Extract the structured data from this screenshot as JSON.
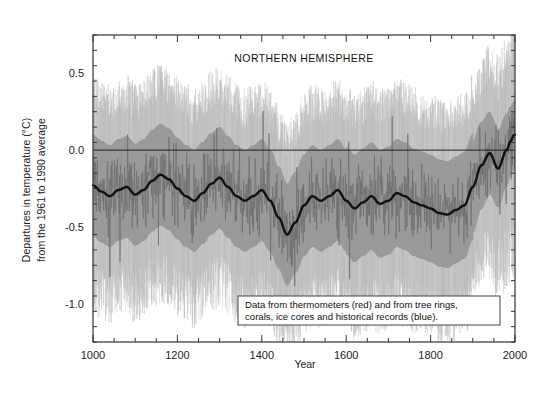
{
  "figure": {
    "title": "(b) the past 1,000 years",
    "panel_annotation": "NORTHERN HEMISPHERE",
    "legend_note_line1": "Data from thermometers (red) and from tree rings,",
    "legend_note_line2": "corals, ice cores and historical records (blue)."
  },
  "colors": {
    "background": "#ffffff",
    "axis": "#333333",
    "uncertainty_band": "#b4b4b4",
    "smoothed_curve": "#111111",
    "annual_series": "#6e6e6e",
    "zero_line": "#222222",
    "legend_border": "#444444"
  },
  "chart_data": {
    "type": "line",
    "title": "(b) the past 1,000 years",
    "subtitle": "NORTHERN HEMISPHERE",
    "xlabel": "Year",
    "ylabel": "Departures in temperature (°C) from the 1961 to 1990 average",
    "xlim": [
      1000,
      2000
    ],
    "ylim": [
      -1.25,
      0.75
    ],
    "xticks": [
      1000,
      1200,
      1400,
      1600,
      1800,
      2000
    ],
    "xtick_labels": [
      "1000",
      "1200",
      "1400",
      "1600",
      "1800",
      "2000"
    ],
    "yticks": [
      0.5,
      0.0,
      -0.5,
      -1.0
    ],
    "ytick_labels": [
      "0.5",
      "0.0",
      "-0.5",
      "-1.0"
    ],
    "minor_xtick_interval": 50,
    "minor_ytick_interval": 0.1,
    "grid": false,
    "legend_position": "inside-bottom-right",
    "reference_line_y": 0.0,
    "series": [
      {
        "name": "Smoothed reconstruction (40-year)",
        "style": "thick-dark-line",
        "x": [
          1000,
          1020,
          1040,
          1060,
          1080,
          1100,
          1120,
          1140,
          1160,
          1180,
          1200,
          1220,
          1240,
          1260,
          1280,
          1300,
          1320,
          1340,
          1360,
          1380,
          1400,
          1420,
          1440,
          1460,
          1480,
          1500,
          1520,
          1540,
          1560,
          1580,
          1600,
          1620,
          1640,
          1660,
          1680,
          1700,
          1720,
          1740,
          1760,
          1780,
          1800,
          1820,
          1840,
          1860,
          1880,
          1900,
          1920,
          1940,
          1960,
          1980,
          1990,
          1998
        ],
        "values": [
          -0.23,
          -0.27,
          -0.3,
          -0.26,
          -0.24,
          -0.29,
          -0.26,
          -0.2,
          -0.16,
          -0.19,
          -0.25,
          -0.3,
          -0.33,
          -0.28,
          -0.22,
          -0.18,
          -0.24,
          -0.3,
          -0.33,
          -0.3,
          -0.26,
          -0.33,
          -0.44,
          -0.55,
          -0.47,
          -0.36,
          -0.3,
          -0.33,
          -0.3,
          -0.26,
          -0.33,
          -0.38,
          -0.34,
          -0.3,
          -0.35,
          -0.33,
          -0.28,
          -0.3,
          -0.34,
          -0.36,
          -0.38,
          -0.41,
          -0.42,
          -0.39,
          -0.36,
          -0.24,
          -0.1,
          -0.02,
          -0.12,
          0.0,
          0.06,
          0.1
        ]
      },
      {
        "name": "Annual reconstruction",
        "style": "thin-gray-line"
      },
      {
        "name": "Uncertainty range (95%)",
        "style": "gray-shaded-band",
        "upper_at_1000": 0.3,
        "lower_at_1000": -0.85,
        "upper_at_1500": 0.25,
        "lower_at_1500": -1.05,
        "upper_at_1900": 0.2,
        "lower_at_1900": -0.8,
        "upper_at_1998": 0.7,
        "lower_at_1998": -0.25
      }
    ]
  }
}
